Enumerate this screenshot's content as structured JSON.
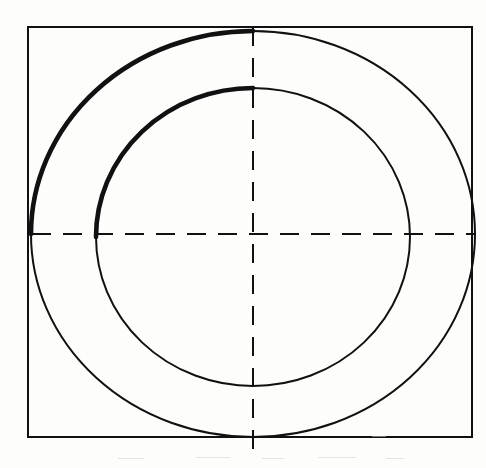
{
  "document": {
    "title": "Concentric Circles Inscribed in Square",
    "background_color": "#fdfdfb",
    "ink_color": "#111111",
    "media": "scanned line drawing"
  },
  "canvas": {
    "width": 486,
    "height": 468
  },
  "geometry": {
    "center": {
      "x": 253,
      "y": 234
    },
    "square": {
      "name": "bounding-square",
      "left": 28,
      "top": 27,
      "right": 472,
      "bottom": 437,
      "width": 444,
      "height": 410,
      "stroke_width": 2.0,
      "stroke_color": "#111111",
      "fill": "none"
    },
    "outer_circle": {
      "name": "outer-circle",
      "cx": 253,
      "cy": 234,
      "rx": 222,
      "ry": 203,
      "stroke_width_thin": 2.0,
      "stroke_width_thick": 4.6,
      "stroke_color": "#111111",
      "fill": "none",
      "heavy_arc_quadrant": "upper-left",
      "heavy_arc_start_deg": 180,
      "heavy_arc_end_deg": 270
    },
    "inner_circle": {
      "name": "inner-circle",
      "cx": 253,
      "cy": 237,
      "rx": 157,
      "ry": 149,
      "stroke_width_thin": 2.0,
      "stroke_width_thick": 4.6,
      "stroke_color": "#111111",
      "fill": "none",
      "heavy_arc_quadrant": "upper-left",
      "heavy_arc_start_deg": 180,
      "heavy_arc_end_deg": 270
    },
    "horizontal_centerline": {
      "name": "horizontal-centerline",
      "x1": 32,
      "y1": 234,
      "x2": 476,
      "y2": 234,
      "style": "dashed",
      "dash_length": 19,
      "gap_length": 12,
      "stroke_width": 2.0,
      "stroke_color": "#111111"
    },
    "vertical_centerline": {
      "name": "vertical-centerline",
      "x1": 253,
      "y1": 27,
      "x2": 253,
      "y2": 455,
      "style": "dashed",
      "dash_length": 19,
      "gap_length": 12,
      "stroke_width": 2.0,
      "stroke_color": "#111111"
    }
  },
  "chart_data": {
    "type": "line",
    "xlabel": "",
    "ylabel": "",
    "xlim": [
      0,
      486
    ],
    "ylim": [
      468,
      0
    ],
    "grid": false,
    "legend": "none",
    "series": [
      {
        "name": "bounding-square",
        "shape": "rectangle",
        "x": [
          28,
          472,
          472,
          28,
          28
        ],
        "y": [
          27,
          27,
          437,
          437,
          27
        ],
        "linewidth": 2.0,
        "color": "#111111"
      },
      {
        "name": "outer-circle",
        "shape": "ellipse",
        "cx": 253,
        "cy": 234,
        "rx": 222,
        "ry": 203,
        "linewidth": 2.0,
        "emphasis_linewidth": 4.6,
        "emphasis_arc_deg": [
          180,
          270
        ],
        "color": "#111111"
      },
      {
        "name": "inner-circle",
        "shape": "ellipse",
        "cx": 253,
        "cy": 237,
        "rx": 157,
        "ry": 149,
        "linewidth": 2.0,
        "emphasis_linewidth": 4.6,
        "emphasis_arc_deg": [
          180,
          270
        ],
        "color": "#111111"
      },
      {
        "name": "horizontal-centerline",
        "shape": "dashed-line",
        "x": [
          32,
          476
        ],
        "y": [
          234,
          234
        ],
        "linewidth": 2.0,
        "color": "#111111"
      },
      {
        "name": "vertical-centerline",
        "shape": "dashed-line",
        "x": [
          253,
          253
        ],
        "y": [
          27,
          455
        ],
        "linewidth": 2.0,
        "color": "#111111"
      }
    ],
    "annotations": []
  }
}
